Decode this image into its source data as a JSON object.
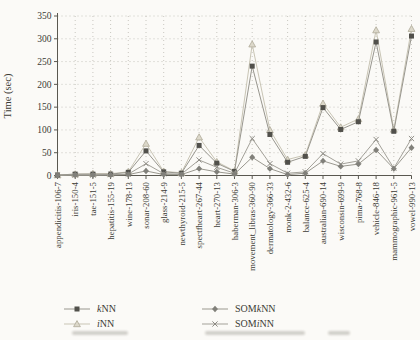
{
  "figure": {
    "ylabel": "Time (sec)",
    "legend": [
      {
        "pre": "",
        "it": "k",
        "post": "NN",
        "marker": "square"
      },
      {
        "pre": "",
        "it": "i",
        "post": "NN",
        "marker": "triangle"
      },
      {
        "pre": "SOM",
        "it": "k",
        "post": "NN",
        "marker": "diamond"
      },
      {
        "pre": "SOM",
        "it": "i",
        "post": "NN",
        "marker": "x"
      }
    ]
  },
  "chart_data": {
    "type": "line",
    "title": "",
    "xlabel": "",
    "ylabel": "Time (sec)",
    "ylim": [
      0,
      350
    ],
    "ytick_step": 50,
    "grid": true,
    "grid_style": "dotted",
    "legend_position": "bottom-left",
    "categories": [
      "appendicitis-106-7",
      "iris-150-4",
      "tae-151-5",
      "hepatitis-155-19",
      "wine-178-13",
      "sonar-208-60",
      "glass-214-9",
      "newthyroid-215-5",
      "spectfheart-267-44",
      "heart-270-13",
      "haberman-306-3",
      "movement_libras-360-90",
      "dermatology-366-33",
      "monk-2-432-6",
      "balance-625-4",
      "australian-690-14",
      "wisconsin-699-9",
      "pima-768-8",
      "vehicle-846-18",
      "mammographic-961-5",
      "vowel-990-13"
    ],
    "series": [
      {
        "name": "kNN",
        "marker": "square",
        "marker_color": "#51504b",
        "line_color": "#98968e",
        "values": [
          1,
          3,
          3,
          3,
          7,
          54,
          8,
          5,
          66,
          27,
          9,
          240,
          90,
          29,
          42,
          149,
          101,
          118,
          293,
          97,
          306
        ]
      },
      {
        "name": "iNN",
        "marker": "triangle",
        "marker_color": "#dcd8ca",
        "marker_stroke": "#afaa98",
        "line_color": "#c9c5b5",
        "values": [
          1,
          3,
          4,
          4,
          8,
          70,
          9,
          6,
          84,
          30,
          10,
          288,
          100,
          35,
          45,
          158,
          106,
          124,
          319,
          101,
          322
        ]
      },
      {
        "name": "SOMkNN",
        "marker": "diamond",
        "marker_color": "#81807a",
        "line_color": "#9a988f",
        "values": [
          0.5,
          1,
          1,
          1,
          2,
          10,
          2,
          2,
          15,
          8,
          3,
          40,
          15,
          2,
          5,
          32,
          20,
          25,
          56,
          15,
          61
        ]
      },
      {
        "name": "SOMiNN",
        "marker": "x",
        "marker_color": "#8d8b84",
        "line_color": "#a3a199",
        "values": [
          0.5,
          1,
          1,
          2,
          3,
          26,
          4,
          3,
          34,
          18,
          5,
          81,
          26,
          5,
          8,
          48,
          25,
          32,
          79,
          16,
          81
        ]
      }
    ],
    "colors": {
      "background": "#fbfaf7",
      "axis": "#5a5850",
      "gridline": "#bcbab2",
      "text": "#3b3a35"
    }
  }
}
